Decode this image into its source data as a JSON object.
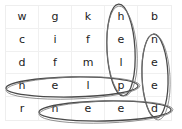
{
  "puzzle": {
    "type": "word-search",
    "rows": 5,
    "cols": 5,
    "grid": [
      [
        "w",
        "g",
        "k",
        "h",
        "b"
      ],
      [
        "c",
        "i",
        "f",
        "e",
        "n"
      ],
      [
        "d",
        "f",
        "m",
        "l",
        "e"
      ],
      [
        "h",
        "e",
        "l",
        "p",
        "e"
      ],
      [
        "r",
        "n",
        "e",
        "e",
        "d"
      ]
    ],
    "found_words": [
      {
        "word": "help",
        "direction": "vertical",
        "cells": [
          [
            0,
            3
          ],
          [
            1,
            3
          ],
          [
            2,
            3
          ],
          [
            3,
            3
          ]
        ]
      },
      {
        "word": "need",
        "direction": "vertical",
        "cells": [
          [
            1,
            4
          ],
          [
            2,
            4
          ],
          [
            3,
            4
          ],
          [
            4,
            4
          ]
        ]
      },
      {
        "word": "help",
        "direction": "horizontal",
        "cells": [
          [
            3,
            0
          ],
          [
            3,
            1
          ],
          [
            3,
            2
          ],
          [
            3,
            3
          ]
        ]
      },
      {
        "word": "need",
        "direction": "horizontal",
        "cells": [
          [
            4,
            1
          ],
          [
            4,
            2
          ],
          [
            4,
            3
          ],
          [
            4,
            4
          ]
        ]
      }
    ],
    "colors": {
      "letter": "#222222",
      "gridline": "#f0f0f0",
      "loop": "#4a4a4a"
    }
  }
}
